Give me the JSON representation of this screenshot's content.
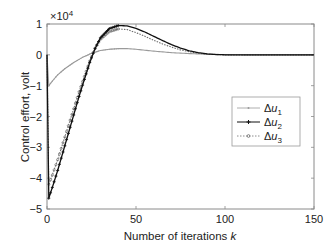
{
  "chart_data": {
    "type": "line",
    "title": "",
    "xlabel": "Number of iterations k",
    "xlabel_main": "Number of iterations ",
    "xlabel_var": "k",
    "ylabel": "Control effort, volt",
    "y_multiplier": "×10",
    "y_multiplier_exp": "4",
    "xlim": [
      0,
      150
    ],
    "ylim": [
      -5,
      1
    ],
    "x_ticks": [
      0,
      50,
      100,
      150
    ],
    "y_ticks": [
      1,
      0,
      -1,
      -2,
      -3,
      -4,
      -5
    ],
    "x_tick_labels": [
      "0",
      "50",
      "100",
      "150"
    ],
    "y_tick_labels": [
      "1",
      "0",
      "−1",
      "−2",
      "−3",
      "−4",
      "−5"
    ],
    "grid": false,
    "legend_position": "right-middle",
    "series": [
      {
        "name": "Δu1",
        "color": "#9a9a9a",
        "marker": "dot",
        "x": [
          0,
          1,
          3,
          6,
          10,
          15,
          20,
          25,
          30,
          35,
          40,
          45,
          50,
          60,
          70,
          80,
          90,
          100,
          110,
          120,
          130,
          140,
          150
        ],
        "values": [
          0,
          -1.0,
          -0.85,
          -0.65,
          -0.45,
          -0.25,
          -0.08,
          0.05,
          0.14,
          0.18,
          0.2,
          0.2,
          0.18,
          0.12,
          0.07,
          0.04,
          0.02,
          0.01,
          0.0,
          0.0,
          0.0,
          0.0,
          0.0
        ]
      },
      {
        "name": "Δu2",
        "color": "#111111",
        "marker": "plus",
        "x": [
          0,
          1,
          3,
          6,
          9,
          12,
          15,
          18,
          21,
          24,
          27,
          30,
          35,
          40,
          45,
          50,
          55,
          60,
          65,
          70,
          75,
          80,
          85,
          90,
          95,
          100,
          110,
          120,
          130,
          140,
          150
        ],
        "values": [
          0,
          -4.65,
          -4.3,
          -3.75,
          -3.15,
          -2.55,
          -1.95,
          -1.35,
          -0.8,
          -0.25,
          0.2,
          0.55,
          0.85,
          0.95,
          0.94,
          0.86,
          0.74,
          0.6,
          0.46,
          0.33,
          0.22,
          0.13,
          0.07,
          0.03,
          0.01,
          0.0,
          0.0,
          0.0,
          0.0,
          0.0,
          0.0
        ]
      },
      {
        "name": "Δu3",
        "color": "#6e6e6e",
        "marker": "circle",
        "x": [
          0,
          1,
          3,
          6,
          9,
          12,
          15,
          18,
          21,
          24,
          27,
          30,
          35,
          40,
          45,
          50,
          55,
          60,
          65,
          70,
          75,
          80,
          85,
          90,
          95,
          100,
          110,
          120,
          130,
          140,
          150
        ],
        "values": [
          0,
          -4.2,
          -3.9,
          -3.4,
          -2.85,
          -2.3,
          -1.75,
          -1.2,
          -0.7,
          -0.2,
          0.22,
          0.5,
          0.75,
          0.84,
          0.82,
          0.72,
          0.6,
          0.47,
          0.35,
          0.25,
          0.16,
          0.1,
          0.05,
          0.02,
          0.01,
          0.0,
          0.0,
          0.0,
          0.0,
          0.0,
          0.0
        ]
      }
    ]
  },
  "legend": {
    "items": [
      {
        "symbol": "Δ",
        "var": "u",
        "sub": "1"
      },
      {
        "symbol": "Δ",
        "var": "u",
        "sub": "2"
      },
      {
        "symbol": "Δ",
        "var": "u",
        "sub": "3"
      }
    ]
  }
}
